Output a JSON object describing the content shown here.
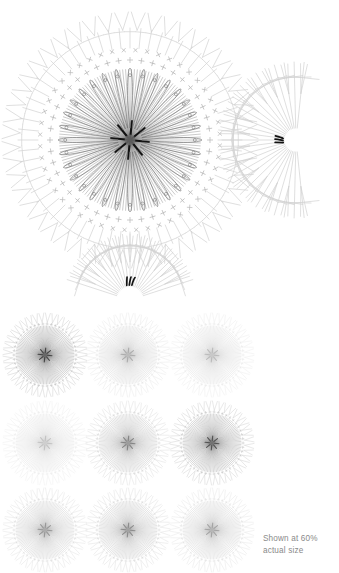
{
  "document": {
    "type": "crochet-pattern-chart",
    "title": "Crochet Motif Stitch Diagram",
    "background_color": "#ffffff"
  },
  "caption": {
    "line1": "Shown at 60%",
    "line2": "actual size",
    "color": "#8a8a8a"
  },
  "colors": {
    "ink_dark": "#3a3a3a",
    "ink_mid": "#6e6e6e",
    "ink_light": "#b9b9b9",
    "ink_faint": "#d2d2d2",
    "accent_black": "#121212",
    "caption_gray": "#8a8a8a",
    "background": "#ffffff"
  },
  "main_motif": {
    "name": "large-motif",
    "center_x": 130,
    "center_y": 140,
    "outer_radius": 128,
    "ray_count": 96,
    "petal_count": 32,
    "petal_inner_radius": 12,
    "petal_outer_radius": 72,
    "rings": [
      {
        "name": "burst-core",
        "radius": 14,
        "symbol": "ray",
        "count": 96,
        "color": "#4a4a4a"
      },
      {
        "name": "petal-ring",
        "radius": 72,
        "symbol": "loop",
        "count": 32,
        "color": "#5a5a5a"
      },
      {
        "name": "cross-stitch-ring-inner",
        "radius": 80,
        "symbol": "+",
        "count": 44,
        "color": "#9a9a9a"
      },
      {
        "name": "cross-stitch-ring-outer",
        "radius": 90,
        "symbol": "x",
        "count": 48,
        "color": "#aeaeae"
      },
      {
        "name": "treble-ring",
        "radius": 112,
        "symbol": "T",
        "count": 64,
        "color": "#c2c2c2"
      },
      {
        "name": "edge-ring",
        "radius": 128,
        "symbol": "V",
        "count": 48,
        "color": "#cfcfcf"
      }
    ]
  },
  "side_detail": {
    "name": "right-edge-detail",
    "center_x": 296,
    "center_y": 140,
    "inner_radius": 12,
    "outer_radius": 78,
    "stitch_count": 26,
    "arc_start_deg": -96,
    "arc_end_deg": 96,
    "chain_marks": 3,
    "chain_mark_color": "#121212"
  },
  "bottom_detail": {
    "name": "bottom-edge-detail",
    "center_x": 130,
    "center_y": 300,
    "inner_radius": 14,
    "outer_radius": 66,
    "stitch_count": 22,
    "arc_start_deg": 198,
    "arc_end_deg": 342,
    "chain_marks": 3,
    "chain_mark_color": "#121212"
  },
  "thumbnail_grid": {
    "name": "motif-thumbnail-grid",
    "columns": 3,
    "rows": 3,
    "column_centers": [
      45,
      128,
      212
    ],
    "row_centers": [
      355,
      443,
      530
    ],
    "radius": 42,
    "items": [
      {
        "index": 0,
        "row": 0,
        "col": 0,
        "opacity": 0.95,
        "label": "thumbnail-1"
      },
      {
        "index": 1,
        "row": 0,
        "col": 1,
        "opacity": 0.42,
        "label": "thumbnail-2"
      },
      {
        "index": 2,
        "row": 0,
        "col": 2,
        "opacity": 0.34,
        "label": "thumbnail-3"
      },
      {
        "index": 3,
        "row": 1,
        "col": 0,
        "opacity": 0.3,
        "label": "thumbnail-4"
      },
      {
        "index": 4,
        "row": 1,
        "col": 1,
        "opacity": 0.62,
        "label": "thumbnail-5"
      },
      {
        "index": 5,
        "row": 1,
        "col": 2,
        "opacity": 0.88,
        "label": "thumbnail-6"
      },
      {
        "index": 6,
        "row": 2,
        "col": 0,
        "opacity": 0.52,
        "label": "thumbnail-7"
      },
      {
        "index": 7,
        "row": 2,
        "col": 1,
        "opacity": 0.58,
        "label": "thumbnail-8"
      },
      {
        "index": 8,
        "row": 2,
        "col": 2,
        "opacity": 0.46,
        "label": "thumbnail-9"
      }
    ]
  }
}
